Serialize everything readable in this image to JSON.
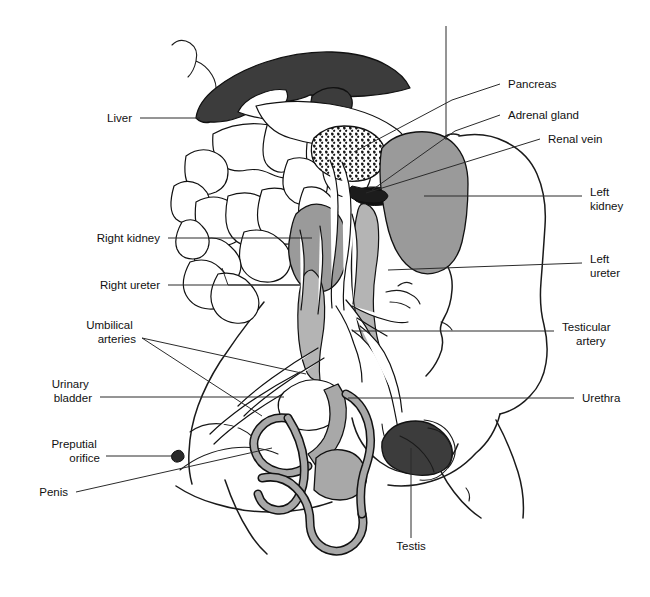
{
  "figure": {
    "background_color": "#ffffff",
    "width": 650,
    "height": 597
  },
  "palette": {
    "outline": "#1a1a1a",
    "leader_line": "#2b2b2b",
    "liver_fill": "#3c3c3c",
    "testis_fill": "#3c3c3c",
    "kidney_fill": "#9a9a9a",
    "ureter_fill": "#b4b4b4",
    "penis_urethra_fill": "#a8a8a8",
    "intestine_fill": "#ffffff",
    "pancreas_fill": "#ffffff",
    "text": "#111111"
  },
  "labels": [
    {
      "id": "liver",
      "name": "Liver",
      "lines": [
        "Liver"
      ],
      "text_anchor": "end",
      "text_x": 132,
      "text_y": 122,
      "leader": "M 140 118 L 200 118",
      "target": [
        200,
        118
      ],
      "side": "left"
    },
    {
      "id": "right-kidney",
      "name": "Right kidney",
      "lines": [
        "Right kidney"
      ],
      "text_anchor": "end",
      "text_x": 160,
      "text_y": 242,
      "leader": "M 168 238 L 312 238",
      "target": [
        312,
        238
      ],
      "side": "left"
    },
    {
      "id": "right-ureter",
      "name": "Right ureter",
      "lines": [
        "Right ureter"
      ],
      "text_anchor": "end",
      "text_x": 160,
      "text_y": 289,
      "leader": "M 168 285 L 300 285 L 228 285 M 300 285 L 228 285",
      "target": [
        300,
        285
      ],
      "side": "left"
    },
    {
      "id": "umbilical-arteries",
      "name": "Umbilical arteries",
      "lines": [
        "Umbilical",
        "arteries"
      ],
      "text_anchor": "end",
      "text_x": 136,
      "text_y": 329,
      "leader": "M 142 338 L 300 372",
      "target": [
        300,
        372
      ],
      "side": "left"
    },
    {
      "id": "urinary-bladder",
      "name": "Urinary bladder",
      "lines": [
        "Urinary",
        "bladder"
      ],
      "text_anchor": "end",
      "text_x": 92,
      "text_y": 388,
      "leader": "M 100 397 L 284 397",
      "target": [
        284,
        397
      ],
      "side": "left"
    },
    {
      "id": "preputial-orifice",
      "name": "Preputial orifice",
      "lines": [
        "Preputial",
        "orifice"
      ],
      "text_anchor": "end",
      "text_x": 100,
      "text_y": 448,
      "leader": "M 106 456 L 176 456",
      "target": [
        176,
        456
      ],
      "side": "left"
    },
    {
      "id": "penis",
      "name": "Penis",
      "lines": [
        "Penis"
      ],
      "text_anchor": "end",
      "text_x": 68,
      "text_y": 496,
      "leader": "M 76 492 L 258 454",
      "target": [
        258,
        454
      ],
      "side": "left"
    },
    {
      "id": "pancreas",
      "name": "Pancreas",
      "lines": [
        "Pancreas"
      ],
      "text_anchor": "start",
      "text_x": 508,
      "text_y": 88,
      "leader": "M 500 84 L 452 100",
      "target": [
        452,
        100
      ],
      "side": "right"
    },
    {
      "id": "adrenal-gland",
      "name": "Adrenal gland",
      "lines": [
        "Adrenal gland"
      ],
      "text_anchor": "start",
      "text_x": 508,
      "text_y": 119,
      "leader": "M 500 115 L 455 131",
      "target": [
        455,
        131
      ],
      "side": "right"
    },
    {
      "id": "renal-vein",
      "name": "Renal vein",
      "lines": [
        "Renal vein"
      ],
      "text_anchor": "start",
      "text_x": 548,
      "text_y": 143,
      "leader": "M 540 139 L 365 192",
      "target": [
        365,
        192
      ],
      "side": "right"
    },
    {
      "id": "left-kidney",
      "name": "Left kidney",
      "lines": [
        "Left",
        "kidney"
      ],
      "text_anchor": "start",
      "text_x": 590,
      "text_y": 196,
      "leader": "M 582 196 L 424 196",
      "target": [
        424,
        196
      ],
      "side": "right"
    },
    {
      "id": "left-ureter",
      "name": "Left ureter",
      "lines": [
        "Left",
        "ureter"
      ],
      "text_anchor": "start",
      "text_x": 590,
      "text_y": 263,
      "leader": "M 582 263 L 388 263",
      "target": [
        388,
        263
      ],
      "side": "right"
    },
    {
      "id": "testicular-artery",
      "name": "Testicular artery",
      "lines": [
        "Testicular",
        "artery"
      ],
      "text_anchor": "start",
      "text_x": 562,
      "text_y": 331,
      "leader": "M 554 331 L 352 331",
      "target": [
        352,
        331
      ],
      "side": "right"
    },
    {
      "id": "urethra",
      "name": "Urethra",
      "lines": [
        "Urethra"
      ],
      "text_anchor": "start",
      "text_x": 582,
      "text_y": 402,
      "leader": "M 574 398 L 348 398",
      "target": [
        348,
        398
      ],
      "side": "right"
    },
    {
      "id": "testis",
      "name": "Testis",
      "lines": [
        "Testis"
      ],
      "text_anchor": "middle",
      "text_x": 411,
      "text_y": 550,
      "leader": "M 411 538 L 411 448",
      "target": [
        411,
        448
      ],
      "side": "bottom"
    }
  ],
  "organs": [
    {
      "id": "liver",
      "label": "Liver",
      "fill": "#3c3c3c"
    },
    {
      "id": "pancreas",
      "label": "Pancreas",
      "fill": "#ffffff"
    },
    {
      "id": "adrenal-gland",
      "label": "Adrenal gland",
      "fill": "#1a1a1a"
    },
    {
      "id": "renal-vein",
      "label": "Renal vein",
      "fill": "#ffffff"
    },
    {
      "id": "left-kidney",
      "label": "Left kidney",
      "fill": "#9a9a9a"
    },
    {
      "id": "right-kidney",
      "label": "Right kidney",
      "fill": "#9a9a9a"
    },
    {
      "id": "left-ureter",
      "label": "Left ureter",
      "fill": "#b4b4b4"
    },
    {
      "id": "right-ureter",
      "label": "Right ureter",
      "fill": "#b4b4b4"
    },
    {
      "id": "urinary-bladder",
      "label": "Urinary bladder",
      "fill": "#ffffff"
    },
    {
      "id": "umbilical-arteries",
      "label": "Umbilical arteries",
      "fill": "#ffffff"
    },
    {
      "id": "urethra",
      "label": "Urethra",
      "fill": "#a8a8a8"
    },
    {
      "id": "penis",
      "label": "Penis",
      "fill": "#a8a8a8"
    },
    {
      "id": "preputial-orifice",
      "label": "Preputial orifice",
      "fill": "#3c3c3c"
    },
    {
      "id": "testis",
      "label": "Testis",
      "fill": "#3c3c3c"
    },
    {
      "id": "testicular-artery",
      "label": "Testicular artery",
      "fill": "#ffffff"
    },
    {
      "id": "intestines",
      "label": "Intestines",
      "fill": "#ffffff"
    }
  ]
}
